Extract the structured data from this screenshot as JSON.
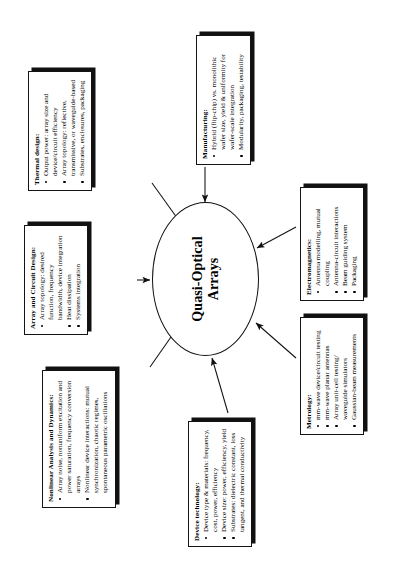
{
  "diagram": {
    "type": "concept-map",
    "orientation_note_hidden": true,
    "center": {
      "label_line1": "Quasi-Optical",
      "label_line2": "Arrays"
    },
    "nodes": [
      {
        "id": "nonlinear",
        "title": "Nonlinear Analysis and Dynamics:",
        "items": [
          "Array noise, nonuniform excitation and power saturation, frequency conversion arrays",
          "Nonlinear device interactions:  mutual synchronization, chaotic regimes, spontaneous parametric oscillations"
        ]
      },
      {
        "id": "array",
        "title": "Array and Circuit Design:",
        "items": [
          "Array topology: desired function, frequency bandwidth, device integration",
          "Heat dissipation",
          "Systems integration"
        ]
      },
      {
        "id": "thermal",
        "title": "Thermal design:",
        "items": [
          "Output power: array size and device/circuit efficiency",
          "Array topology: reflective, transmissive, or waveguide-based",
          "Substrates, enclosures, packaging"
        ]
      },
      {
        "id": "device",
        "title": "Device technology:",
        "items": [
          "Device type & materials: frequency, cost, power, efficiency",
          "Device size: power, efficiency, yield",
          "Substrates: dielectric constant, loss tangent, and thermal conductivity"
        ]
      },
      {
        "id": "manufacturing",
        "title": "Manufacturing:",
        "items": [
          "Hybrid (flip-chip) vs. monolithic",
          "wafer size, yield & uniformity for wafer-scale integration",
          "Modularity, packaging, testability"
        ]
      },
      {
        "id": "metrology",
        "title": "Metrology:",
        "items": [
          "mm-wave device/circuit testing",
          "mm-wave planar antennas",
          "Array unit-cell testing/ waveguide simulators",
          "Gaussian-beam measurements"
        ]
      },
      {
        "id": "electromagnetics",
        "title": "Electromagnetics:",
        "items": [
          "Antenna modelling, mutual coupling",
          "Antenna-circuit interactions",
          "Beam guiding system",
          "Packaging"
        ]
      }
    ],
    "colors": {
      "ink": "#000000",
      "shadow": "#111111",
      "paper": "#ffffff"
    }
  }
}
